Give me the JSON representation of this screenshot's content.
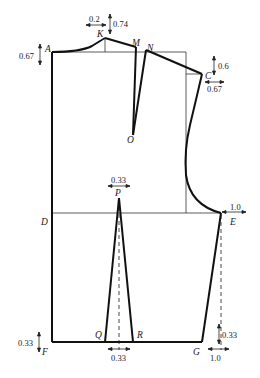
{
  "diagram": {
    "type": "garment-pattern-draft",
    "colors": {
      "line": "#1a1a1a",
      "guide": "#333333",
      "background": "#ffffff"
    },
    "points": {
      "A": {
        "label": "A",
        "x": 52,
        "y": 52
      },
      "K": {
        "label": "K",
        "x": 105,
        "y": 38
      },
      "M": {
        "label": "M",
        "x": 136,
        "y": 47
      },
      "N": {
        "label": "N",
        "x": 146,
        "y": 50
      },
      "C": {
        "label": "C",
        "x": 202,
        "y": 74
      },
      "O": {
        "label": "O",
        "x": 133,
        "y": 135
      },
      "D": {
        "label": "D",
        "x": 52,
        "y": 213
      },
      "E": {
        "label": "E",
        "x": 221,
        "y": 213
      },
      "P": {
        "label": "P",
        "x": 119,
        "y": 198
      },
      "F": {
        "label": "F",
        "x": 52,
        "y": 342
      },
      "Q": {
        "label": "Q",
        "x": 105,
        "y": 342
      },
      "R": {
        "label": "R",
        "x": 133,
        "y": 342
      },
      "G": {
        "label": "G",
        "x": 202,
        "y": 342
      }
    },
    "dimensions": {
      "k_horizontal": "0.2",
      "k_vertical": "0.74",
      "a_vertical": "0.67",
      "c_vertical": "0.6",
      "c_horizontal": "0.67",
      "p_horizontal": "0.33",
      "e_horizontal": "1.0",
      "f_vertical": "0.33",
      "qr_horizontal": "0.33",
      "g_vertical": "0.33",
      "g_horizontal": "1.0"
    }
  }
}
